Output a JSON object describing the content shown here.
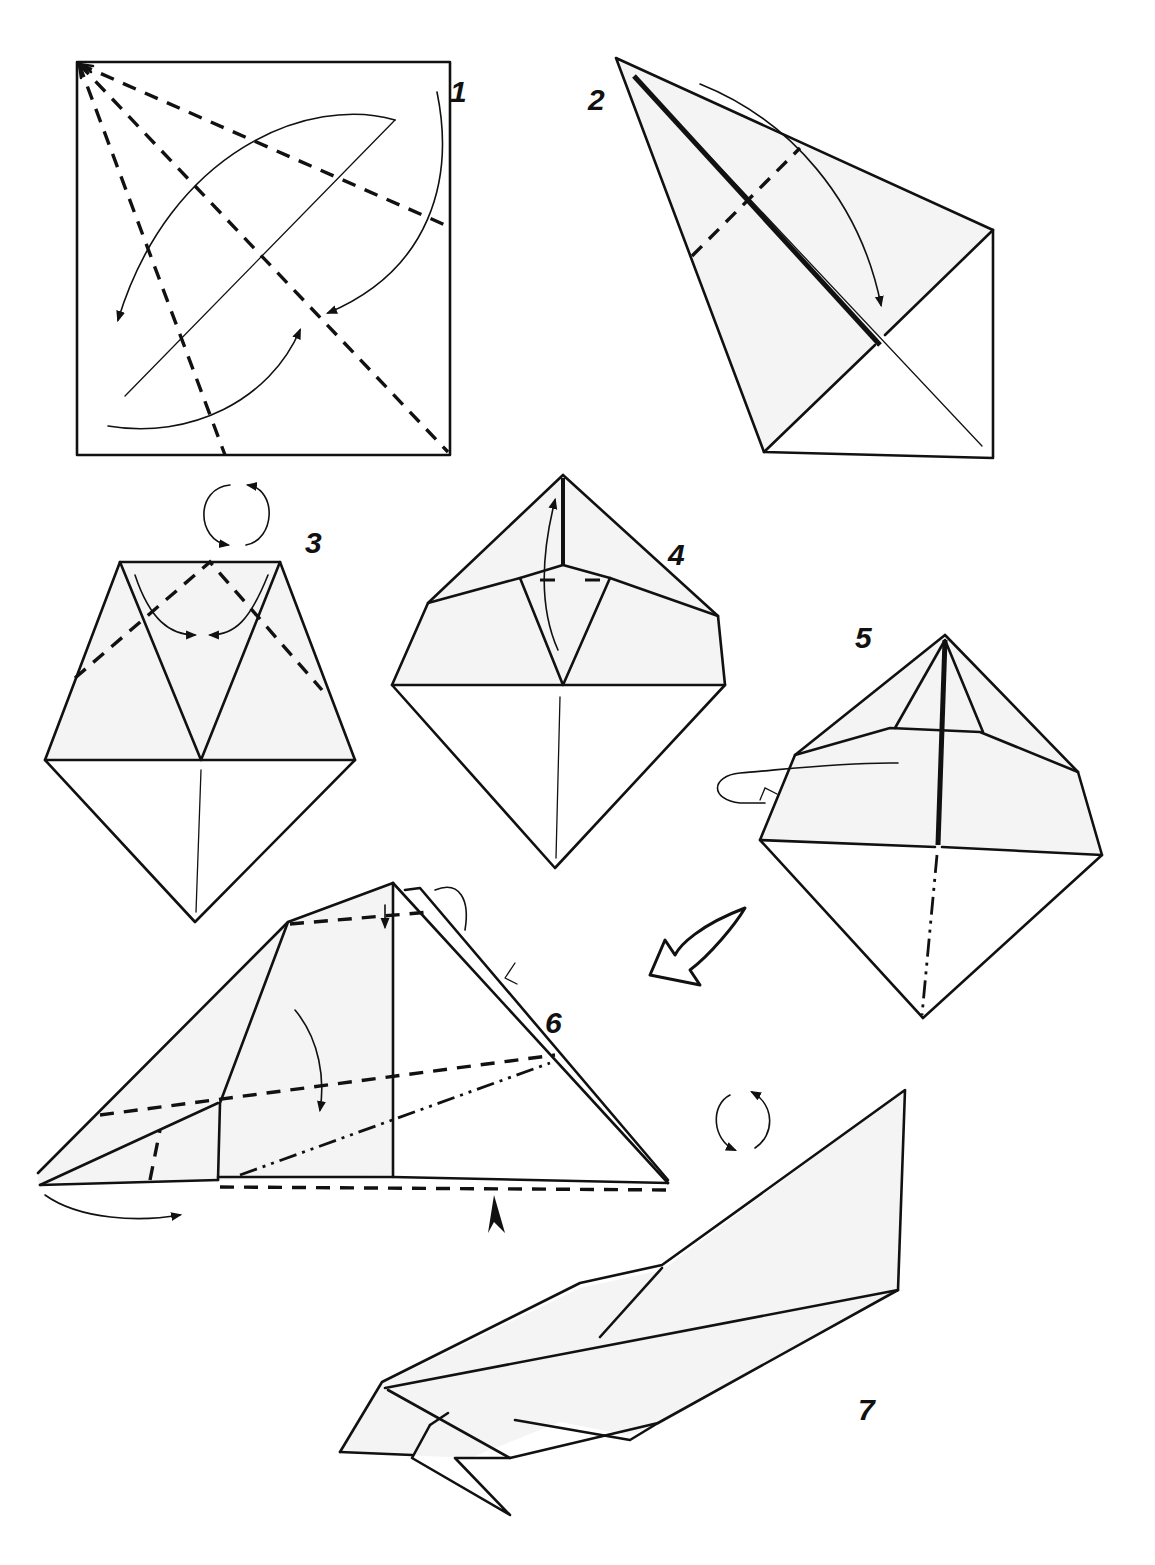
{
  "diagram": {
    "background": "#ffffff",
    "ink_color": "#111111",
    "paper_shade": "#f4f4f4",
    "steps": [
      {
        "number": "1",
        "description": "Square with valley-fold diagonals radiating from top-left corner; curved arrows indicate folding edges to diagonal"
      },
      {
        "number": "2",
        "description": "Kite base with valley fold line across upper flap; curved arrow folding down"
      },
      {
        "number": "3",
        "description": "Turn model over; valley folds forming V at top with curved arrows"
      },
      {
        "number": "4",
        "description": "Diamond with inner triangle; arrow lifting flap upward"
      },
      {
        "number": "5",
        "description": "Diamond with raised point; loop arrow on left (inside reverse fold); mountain fold along vertical centre"
      },
      {
        "number": "6",
        "description": "Side view with valley folds, mountain fold, and push-in arrow at bottom"
      },
      {
        "number": "7",
        "description": "Finished bird"
      }
    ],
    "symbols": {
      "turn_over_1": "turn-over-icon",
      "turn_over_2": "turn-over-icon",
      "next_step_arrow": "hollow-arrow-icon",
      "push_arrow": "push-arrow-icon"
    },
    "legend": {
      "valley_fold": "dashed line",
      "mountain_fold": "dash-dot-dot line"
    }
  }
}
